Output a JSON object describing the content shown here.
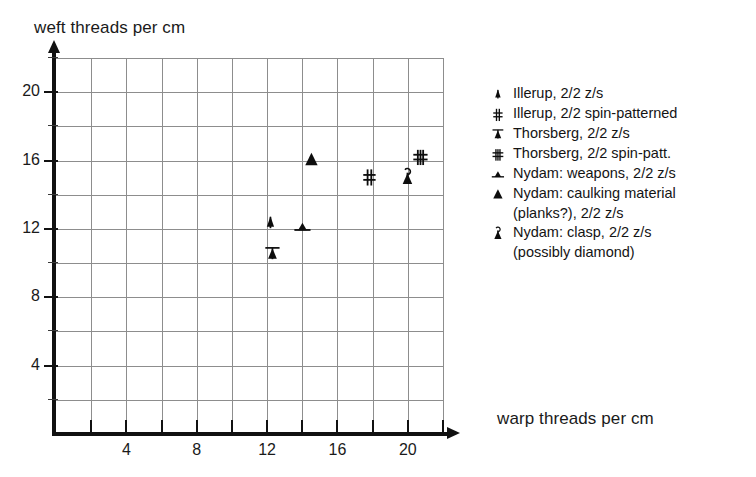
{
  "chart_data": {
    "type": "scatter",
    "title": "",
    "xlabel": "warp threads per cm",
    "ylabel": "weft threads per cm",
    "xlim": [
      0,
      22
    ],
    "ylim": [
      0,
      22
    ],
    "grid": true,
    "grid_step": 2,
    "xticks": [
      2,
      4,
      6,
      8,
      10,
      12,
      14,
      16,
      18,
      20,
      22
    ],
    "xtick_labels": [
      "",
      "4",
      "",
      "8",
      "",
      "12",
      "",
      "16",
      "",
      "20",
      ""
    ],
    "yticks": [
      2,
      4,
      6,
      8,
      10,
      12,
      14,
      16,
      18,
      20,
      22
    ],
    "ytick_labels": [
      "",
      "4",
      "",
      "8",
      "",
      "12",
      "",
      "16",
      "",
      "20",
      ""
    ],
    "legend_position": "right-outside",
    "series": [
      {
        "name": "Illerup, 2/2 z/s",
        "marker": "triangle-stem",
        "points": [
          {
            "x": 12.2,
            "y": 12.3
          }
        ]
      },
      {
        "name": "Illerup, 2/2 spin-patterned",
        "marker": "hash-single",
        "points": [
          {
            "x": 17.8,
            "y": 15.0
          }
        ]
      },
      {
        "name": "Thorsberg, 2/2 z/s",
        "marker": "triangle-topbar",
        "points": [
          {
            "x": 12.3,
            "y": 10.5
          }
        ]
      },
      {
        "name": "Thorsberg, 2/2 spin-patt.",
        "marker": "hash-double",
        "points": [
          {
            "x": 20.7,
            "y": 16.2
          }
        ]
      },
      {
        "name": "Nydam: weapons, 2/2 z/s",
        "marker": "triangle-sidebar",
        "points": [
          {
            "x": 14.0,
            "y": 12.1
          }
        ]
      },
      {
        "name": "Nydam: caulking material (planks?), 2/2 z/s",
        "marker": "triangle-solid",
        "points": [
          {
            "x": 14.5,
            "y": 16.0
          }
        ]
      },
      {
        "name": "Nydam: clasp, 2/2 z/s (possibly diamond)",
        "marker": "clasp",
        "points": [
          {
            "x": 20.0,
            "y": 15.0
          }
        ]
      }
    ]
  },
  "axes": {
    "y_title": "weft threads per cm",
    "x_title": "warp threads per cm",
    "y_labels": [
      {
        "value": 20,
        "text": "20"
      },
      {
        "value": 16,
        "text": "16"
      },
      {
        "value": 12,
        "text": "12"
      },
      {
        "value": 8,
        "text": "8"
      },
      {
        "value": 4,
        "text": "4"
      }
    ],
    "x_labels": [
      {
        "value": 4,
        "text": "4"
      },
      {
        "value": 8,
        "text": "8"
      },
      {
        "value": 12,
        "text": "12"
      },
      {
        "value": 16,
        "text": "16"
      },
      {
        "value": 20,
        "text": "20"
      }
    ]
  },
  "legend": {
    "entries": [
      {
        "symbol": "triangle-stem",
        "label": "Illerup, 2/2 z/s",
        "continuation": ""
      },
      {
        "symbol": "hash-single",
        "label": "Illerup, 2/2 spin-patterned",
        "continuation": ""
      },
      {
        "symbol": "triangle-topbar",
        "label": "Thorsberg, 2/2 z/s",
        "continuation": ""
      },
      {
        "symbol": "hash-double",
        "label": "Thorsberg, 2/2 spin-patt.",
        "continuation": ""
      },
      {
        "symbol": "triangle-sidebar",
        "label": "Nydam: weapons, 2/2 z/s",
        "continuation": ""
      },
      {
        "symbol": "triangle-solid",
        "label": "Nydam: caulking material",
        "continuation": "(planks?), 2/2 z/s"
      },
      {
        "symbol": "clasp",
        "label": "Nydam: clasp, 2/2 z/s",
        "continuation": "(possibly diamond)"
      }
    ]
  },
  "colors": {
    "ink": "#111111",
    "grid": "#8d8d8d",
    "background": "#ffffff"
  }
}
